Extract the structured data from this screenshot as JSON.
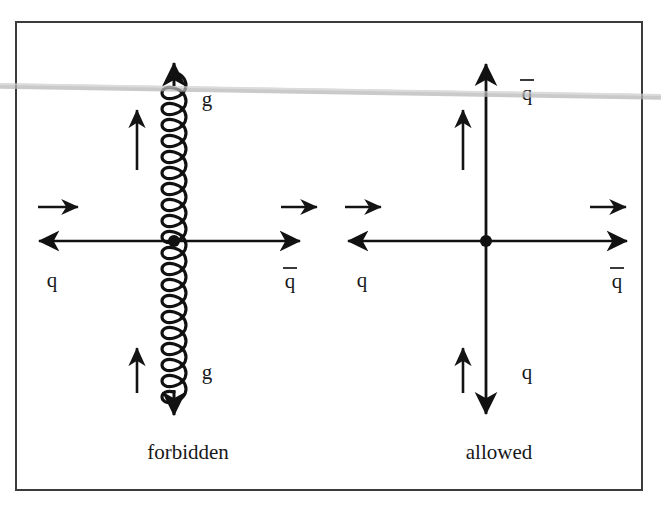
{
  "figure": {
    "frame": {
      "border_color": "#3c3c3c",
      "background": "#ffffff"
    },
    "artifact": {
      "name": "scan-line",
      "color": "#b9b9b9",
      "description": "faint grey horizontal scanner streak across the page"
    }
  },
  "panels": [
    {
      "id": "forbidden",
      "caption": "forbidden",
      "vertex": {
        "label": "vertex-dot",
        "color": "#111111"
      },
      "vertical_line": {
        "type": "gluon",
        "style": "coil",
        "color": "#111111",
        "top_arrow": "up",
        "bottom_arrow": "down"
      },
      "horizontal_line": {
        "type": "fermion",
        "color": "#111111",
        "left_arrow": "left",
        "right_arrow": "right"
      },
      "legs": [
        {
          "name": "left-leg",
          "label": "q",
          "bar": false
        },
        {
          "name": "right-leg",
          "label": "q",
          "bar": true
        },
        {
          "name": "top-leg",
          "label": "g",
          "bar": false
        },
        {
          "name": "bottom-leg",
          "label": "g",
          "bar": false
        }
      ],
      "momentum_arrows": [
        {
          "name": "momentum-arrow-left",
          "direction": "right"
        },
        {
          "name": "momentum-arrow-right",
          "direction": "right"
        },
        {
          "name": "momentum-arrow-top",
          "direction": "up"
        },
        {
          "name": "momentum-arrow-bottom",
          "direction": "up"
        }
      ]
    },
    {
      "id": "allowed",
      "caption": "allowed",
      "vertex": {
        "label": "vertex-dot",
        "color": "#111111"
      },
      "vertical_line": {
        "type": "fermion",
        "style": "straight",
        "color": "#111111",
        "top_arrow": "up",
        "bottom_arrow": "down"
      },
      "horizontal_line": {
        "type": "fermion",
        "color": "#111111",
        "left_arrow": "left",
        "right_arrow": "right"
      },
      "legs": [
        {
          "name": "left-leg",
          "label": "q",
          "bar": false
        },
        {
          "name": "right-leg",
          "label": "q",
          "bar": true
        },
        {
          "name": "top-leg",
          "label": "q",
          "bar": true
        },
        {
          "name": "bottom-leg",
          "label": "q",
          "bar": false
        }
      ],
      "momentum_arrows": [
        {
          "name": "momentum-arrow-left",
          "direction": "right"
        },
        {
          "name": "momentum-arrow-right",
          "direction": "right"
        },
        {
          "name": "momentum-arrow-top",
          "direction": "up"
        },
        {
          "name": "momentum-arrow-bottom",
          "direction": "up"
        }
      ]
    }
  ],
  "labels": {
    "forbidden_caption": "forbidden",
    "allowed_caption": "allowed",
    "q": "q",
    "g": "g",
    "left_q_forbidden": "q",
    "right_q_forbidden": "q",
    "top_g_forbidden": "g",
    "bottom_g_forbidden": "g",
    "left_q_allowed": "q",
    "right_q_allowed": "q",
    "top_q_allowed": "q",
    "bottom_q_allowed": "q"
  }
}
